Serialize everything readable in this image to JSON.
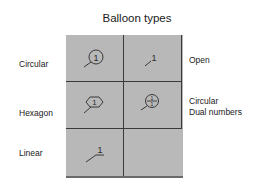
{
  "title": "Balloon types",
  "balloons": [
    {
      "id": "circular",
      "label": "Circular",
      "number": "1",
      "shape": "circle"
    },
    {
      "id": "open",
      "label": "Open",
      "number": "1",
      "shape": "none"
    },
    {
      "id": "hexagon",
      "label": "Hexagon",
      "number": "1",
      "shape": "hexagon"
    },
    {
      "id": "circular-dual",
      "label_line1": "Circular",
      "label_line2": "Dual numbers",
      "number_top": "1",
      "number_bottom": "1",
      "shape": "circle-split"
    },
    {
      "id": "linear",
      "label": "Linear",
      "number": "1",
      "shape": "underline"
    }
  ],
  "colors": {
    "cell_fill": "#b8b8b8",
    "cell_border": "#3a3a3a",
    "ink": "#1a1a1a"
  }
}
